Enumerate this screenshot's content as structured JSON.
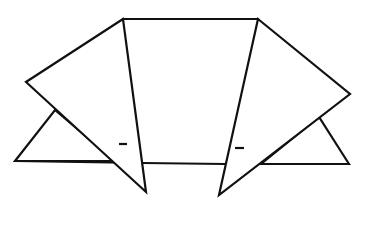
{
  "diagram": {
    "type": "origami-fold-step",
    "stroke_color": "#111111",
    "background_color": "#ffffff",
    "shapes": {
      "center_top_edge": [
        [
          123,
          19
        ],
        [
          258,
          19
        ]
      ],
      "center_baseline": [
        [
          143,
          163
        ],
        [
          225,
          164
        ]
      ],
      "left_lower_triangle": [
        [
          15,
          161
        ],
        [
          55,
          110
        ],
        [
          115,
          161
        ]
      ],
      "right_lower_triangle": [
        [
          349,
          164
        ],
        [
          319,
          117
        ],
        [
          261,
          164
        ]
      ],
      "left_flap": [
        [
          123,
          19
        ],
        [
          26,
          82
        ],
        [
          146,
          192
        ]
      ],
      "right_flap": [
        [
          258,
          19
        ],
        [
          350,
          94
        ],
        [
          219,
          195
        ]
      ]
    },
    "marks": [
      {
        "name": "left-dash",
        "from": [
          119,
          144
        ],
        "to": [
          127,
          144
        ]
      },
      {
        "name": "right-dash",
        "from": [
          235,
          148
        ],
        "to": [
          244,
          148
        ]
      }
    ]
  }
}
